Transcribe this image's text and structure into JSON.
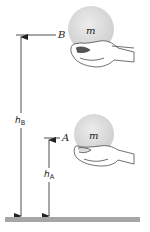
{
  "figure": {
    "type": "physics-diagram",
    "mass_label": "m",
    "positions": [
      {
        "id": "B",
        "label": "B",
        "height_symbol": "h",
        "height_subscript": "B",
        "ball_label": "m"
      },
      {
        "id": "A",
        "label": "A",
        "height_symbol": "h",
        "height_subscript": "A",
        "ball_label": "m"
      }
    ],
    "colors": {
      "ball": "#d9d9d9",
      "ground": "#a6a6a6",
      "lines": "#222222"
    }
  }
}
